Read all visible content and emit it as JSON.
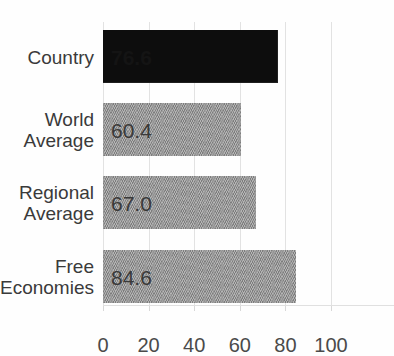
{
  "chart_data": {
    "type": "bar",
    "orientation": "horizontal",
    "title": "",
    "xlabel": "",
    "ylabel": "",
    "xlim": [
      0,
      100
    ],
    "grid": true,
    "legend": false,
    "categories": [
      "Country",
      "World\nAverage",
      "Regional\nAverage",
      "Free\nEconomies"
    ],
    "values": [
      76.6,
      60.4,
      67.0,
      84.6
    ],
    "value_labels": [
      "76.6",
      "60.4",
      "67.0",
      "84.6"
    ],
    "bar_colors": [
      "#0d0d0d",
      "#959595",
      "#959595",
      "#959595"
    ],
    "highlighted_index": 0,
    "xticks": [
      0,
      20,
      40,
      60,
      80,
      100
    ],
    "xtick_labels": [
      "0",
      "20",
      "40",
      "60",
      "80",
      "100"
    ]
  },
  "bars": [
    {
      "label": "Country",
      "value": 76.6,
      "value_label": "76.6",
      "style": "dark",
      "emphasis": "bold"
    },
    {
      "label": "World\nAverage",
      "value": 60.4,
      "value_label": "60.4",
      "style": "grey",
      "emphasis": "normal"
    },
    {
      "label": "Regional\nAverage",
      "value": 67.0,
      "value_label": "67.0",
      "style": "grey",
      "emphasis": "normal"
    },
    {
      "label": "Free\nEconomies",
      "value": 84.6,
      "value_label": "84.6",
      "style": "grey",
      "emphasis": "normal"
    }
  ],
  "axis": {
    "ticks": [
      {
        "label": "0"
      },
      {
        "label": "20"
      },
      {
        "label": "40"
      },
      {
        "label": "60"
      },
      {
        "label": "80"
      },
      {
        "label": "100"
      }
    ]
  },
  "colors": {
    "bar_dark": "#0d0d0d",
    "bar_grey": "#959595",
    "gridline": "#e2e2e2",
    "text": "#3a3a3a",
    "background": "#fefefe"
  }
}
